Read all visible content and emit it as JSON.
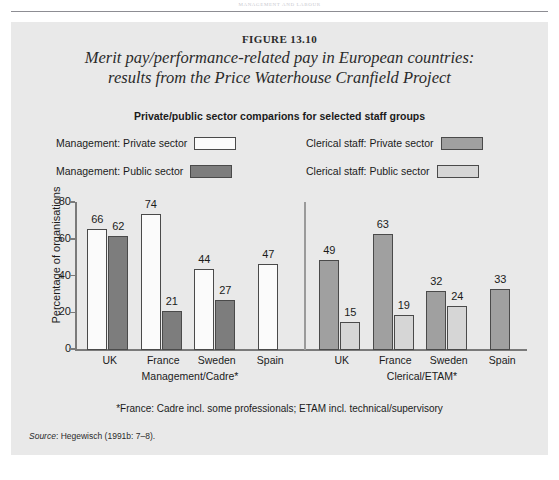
{
  "page": {
    "running_head": "MANAGEMENT AND LABOUR",
    "figure_label": "FIGURE 13.10",
    "figure_title_line1": "Merit pay/performance-related pay in European countries:",
    "figure_title_line2": "results from the Price Waterhouse Cranfield Project",
    "footnote": "*France: Cadre incl. some professionals; ETAM incl. technical/supervisory",
    "source_word": "Source",
    "source_text": ": Hegewisch (1991b: 7–8)."
  },
  "colors": {
    "panel_background": "#e9e9e9",
    "management_private": "#fbfbfb",
    "management_public": "#7d7d7d",
    "clerical_private": "#a0a0a0",
    "clerical_public": "#d6d6d6",
    "axis": "#7a7a7a",
    "text": "#1b1b1b"
  },
  "legend": {
    "items": [
      {
        "label": "Management: Private sector",
        "swatch": "management_private"
      },
      {
        "label": "Management: Public sector",
        "swatch": "management_public"
      },
      {
        "label": "Clerical staff: Private sector",
        "swatch": "clerical_private"
      },
      {
        "label": "Clerical staff: Public sector",
        "swatch": "clerical_public"
      }
    ]
  },
  "chart_data": {
    "type": "bar",
    "title": "Private/public sector comparions for selected staff groups",
    "xlabel": "",
    "ylabel": "Percentage of organisations",
    "ylim": [
      0,
      80
    ],
    "yticks": [
      0,
      20,
      40,
      60,
      80
    ],
    "ytick_labels": [
      "0",
      "20",
      "40",
      "60",
      "80"
    ],
    "grid": false,
    "legend_position": "top",
    "panels": [
      {
        "name": "Management/Cadre*",
        "categories": [
          "UK",
          "France",
          "Sweden",
          "Spain"
        ],
        "series": [
          {
            "name": "Management: Private sector",
            "values": [
              66,
              74,
              44,
              47
            ]
          },
          {
            "name": "Management: Public sector",
            "values": [
              62,
              21,
              27,
              null
            ]
          }
        ]
      },
      {
        "name": "Clerical/ETAM*",
        "categories": [
          "UK",
          "France",
          "Sweden",
          "Spain"
        ],
        "series": [
          {
            "name": "Clerical staff: Private sector",
            "values": [
              49,
              63,
              32,
              33
            ]
          },
          {
            "name": "Clerical staff: Public sector",
            "values": [
              15,
              19,
              24,
              null
            ]
          }
        ]
      }
    ]
  }
}
